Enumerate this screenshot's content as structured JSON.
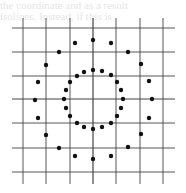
{
  "figure": {
    "type": "dot-grid-diagram",
    "background": "#ffffff",
    "ink_color": "#111111",
    "grid_color": "#444444",
    "bleed_through_text": [
      "the coordinate and as a result",
      "isolines. Instead, if this is"
    ],
    "grid": {
      "vertical_x": [
        23,
        46,
        70,
        93,
        116,
        140,
        163
      ],
      "horizontal_y": [
        28,
        52,
        76,
        99,
        123,
        148,
        172
      ],
      "x_extent": [
        12,
        175
      ],
      "y_extent": [
        18,
        184
      ]
    },
    "center": [
      93,
      99
    ],
    "rings": [
      {
        "name": "outer-ring",
        "radius": 59,
        "dot_count": 20,
        "dot_radius": 2.2,
        "points": [
          [
            93,
            40
          ],
          [
            111,
            43
          ],
          [
            128,
            52
          ],
          [
            141,
            64
          ],
          [
            149,
            81
          ],
          [
            152,
            99
          ],
          [
            149,
            118
          ],
          [
            141,
            134
          ],
          [
            128,
            147
          ],
          [
            111,
            156
          ],
          [
            93,
            159
          ],
          [
            75,
            156
          ],
          [
            59,
            148
          ],
          [
            46,
            135
          ],
          [
            38,
            118
          ],
          [
            35,
            100
          ],
          [
            38,
            82
          ],
          [
            46,
            65
          ],
          [
            59,
            52
          ],
          [
            75,
            43
          ]
        ]
      },
      {
        "name": "inner-ring",
        "radius": 29,
        "dot_count": 20,
        "dot_radius": 2.2,
        "points": [
          [
            93,
            70
          ],
          [
            102,
            71
          ],
          [
            111,
            75
          ],
          [
            117,
            82
          ],
          [
            121,
            90
          ],
          [
            123,
            99
          ],
          [
            121,
            108
          ],
          [
            117,
            116
          ],
          [
            111,
            123
          ],
          [
            102,
            127
          ],
          [
            93,
            129
          ],
          [
            84,
            127
          ],
          [
            77,
            123
          ],
          [
            70,
            116
          ],
          [
            66,
            108
          ],
          [
            64,
            99
          ],
          [
            66,
            90
          ],
          [
            70,
            82
          ],
          [
            77,
            76
          ],
          [
            84,
            72
          ]
        ]
      }
    ]
  }
}
